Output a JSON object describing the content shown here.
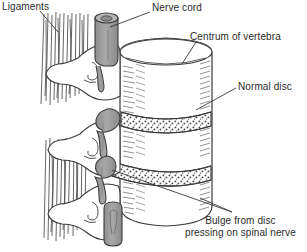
{
  "figure": {
    "width": 307,
    "height": 252,
    "background": "#ffffff",
    "line_color": "#3a3a3a",
    "text_color": "#2b2b2b",
    "nerve_fill": "#9d9d9d",
    "disc_fill": "#ffffff",
    "bone_fill": "#ffffff",
    "hatch_color": "#6f6f6f"
  },
  "labels": {
    "ligaments": "Ligaments",
    "nerve_cord": "Nerve cord",
    "centrum": "Centrum of vertebra",
    "normal_disc": "Normal disc",
    "bulge_line1": "Bulge from disc",
    "bulge_line2": "pressing on spinal nerve"
  },
  "structures": {
    "vertebrae_count": 3,
    "disc_count": 2,
    "nerve_roots_count": 3,
    "ligament_bundles": 2
  }
}
